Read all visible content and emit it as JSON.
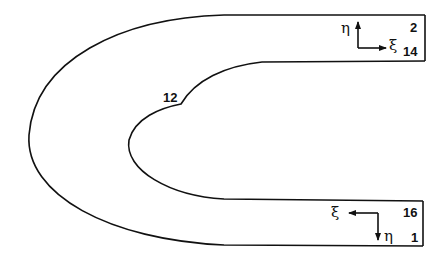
{
  "diagram": {
    "type": "U-shaped computational domain with curvilinear coordinate axes",
    "stroke_color": "#111111",
    "background": "#ffffff",
    "node_labels": {
      "top_right_upper": "2",
      "top_right_lower": "14",
      "inner_corner": "12",
      "bottom_right_upper": "16",
      "bottom_right_lower": "1"
    },
    "axes": {
      "top": {
        "vertical_label": "η",
        "horizontal_label": "ξ",
        "vertical_direction": "up",
        "horizontal_direction": "right"
      },
      "bottom": {
        "vertical_label": "η",
        "horizontal_label": "ξ",
        "vertical_direction": "down",
        "horizontal_direction": "left"
      }
    }
  }
}
